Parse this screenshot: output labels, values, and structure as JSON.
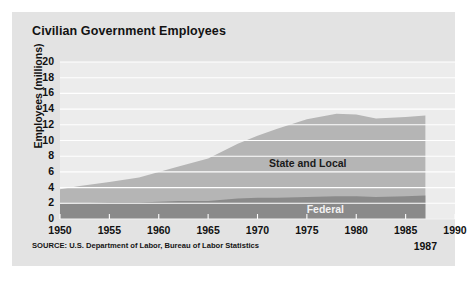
{
  "figure": {
    "title": "Civilian Government Employees",
    "source": "SOURCE: U.S. Department of Labor, Bureau of Labor Statistics",
    "end_year_note": "1987",
    "panel_color": "#e3e3e3"
  },
  "chart_data": {
    "type": "area",
    "stacked": true,
    "title": "Civilian Government Employees",
    "xlabel": "",
    "ylabel": "Employees (millions)",
    "xlim": [
      1950,
      1990
    ],
    "ylim": [
      0,
      20
    ],
    "grid": true,
    "gridlines": "horizontal",
    "grid_color": "#ffffff",
    "legend_position": "inline-annotation",
    "xticks": [
      1950,
      1955,
      1960,
      1965,
      1970,
      1975,
      1980,
      1985,
      1990
    ],
    "yticks": [
      0,
      2,
      4,
      6,
      8,
      10,
      12,
      14,
      16,
      18,
      20
    ],
    "x": [
      1950,
      1952,
      1955,
      1958,
      1960,
      1962,
      1965,
      1968,
      1970,
      1972,
      1975,
      1978,
      1980,
      1982,
      1985,
      1987
    ],
    "series": [
      {
        "name": "Federal",
        "color": "#8a8a8a",
        "values": [
          1.9,
          2.0,
          2.1,
          2.1,
          2.2,
          2.3,
          2.3,
          2.6,
          2.7,
          2.7,
          2.8,
          2.9,
          2.9,
          2.8,
          2.9,
          3.0
        ]
      },
      {
        "name": "State and Local",
        "color": "#b5b5b5",
        "values": [
          1.9,
          2.2,
          2.6,
          3.2,
          3.8,
          4.4,
          5.4,
          7.0,
          7.9,
          8.8,
          9.9,
          10.5,
          10.4,
          10.0,
          10.1,
          10.2
        ]
      }
    ],
    "totals": [
      3.8,
      4.2,
      4.7,
      5.3,
      6.0,
      6.7,
      7.7,
      9.6,
      10.6,
      11.5,
      12.7,
      13.4,
      13.3,
      12.8,
      13.0,
      13.2
    ],
    "annotations": [
      {
        "text": "State and Local",
        "x": 1975,
        "y": 7.0
      },
      {
        "text": "Federal",
        "x": 1977,
        "y": 1.2
      },
      {
        "text": "1987",
        "x": 1987,
        "y": null
      }
    ]
  },
  "axis": {
    "y_label": "Employees (millions)",
    "y_ticks": [
      "20",
      "18",
      "16",
      "14",
      "12",
      "10",
      "8",
      "6",
      "4",
      "2",
      "0"
    ],
    "x_ticks": [
      "1950",
      "1955",
      "1960",
      "1965",
      "1970",
      "1975",
      "1980",
      "1985",
      "1990"
    ]
  },
  "labels": {
    "state_and_local": "State and Local",
    "federal": "Federal"
  }
}
